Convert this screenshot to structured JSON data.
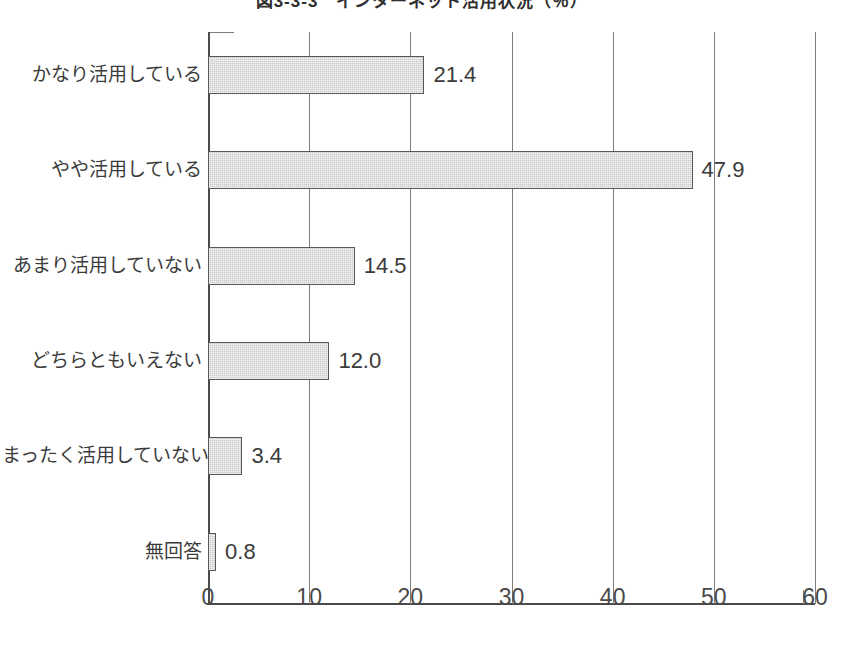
{
  "chart_data": {
    "type": "bar",
    "orientation": "horizontal",
    "title": "図3-3-3　インターネット活用状況（％）",
    "xlabel": "",
    "ylabel": "",
    "xlim": [
      0,
      60
    ],
    "xticks": [
      "0",
      "10",
      "20",
      "30",
      "40",
      "50",
      "60"
    ],
    "grid": true,
    "legend": false,
    "categories": [
      "かなり活用している",
      "やや活用している",
      "あまり活用していない",
      "どちらともいえない",
      "まったく活用していない",
      "無回答"
    ],
    "values": [
      21.4,
      47.9,
      14.5,
      12.0,
      3.4,
      0.8
    ],
    "value_labels": [
      "21.4",
      "47.9",
      "14.5",
      "12.0",
      "3.4",
      "0.8"
    ],
    "bar_fill_color": "#c9c9c9",
    "bar_border_color": "#58585a",
    "axis_color": "#4a4a4a",
    "gridline_color": "#7d7d7d",
    "text_color": "#3b3b3b",
    "background_color": "#ffffff"
  }
}
